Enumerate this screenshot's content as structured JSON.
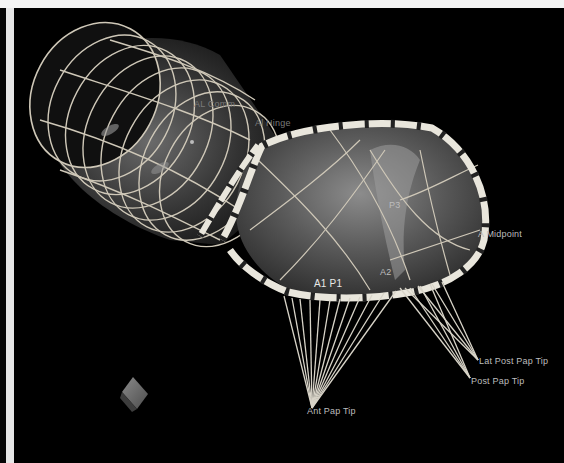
{
  "viewer": {
    "background": "#000000",
    "frame_color": "#e6e6e6"
  },
  "model": {
    "parts": [
      "atrial-tube-mesh",
      "annular-ring",
      "leaflet-surface",
      "chordae-tendineae",
      "orientation-cube"
    ]
  },
  "labels": {
    "al_comm": "AL Comm",
    "al_hinge": "Al Hinge",
    "p3": "P3",
    "a_midpoint": "A Midpoint",
    "a1_p1": "A1 P1",
    "a2": "A2",
    "lat_post_pap_tip": "Lat Post Pap Tip",
    "post_pap_tip": "Post Pap Tip",
    "ant_pap_tip": "Ant Pap Tip"
  }
}
